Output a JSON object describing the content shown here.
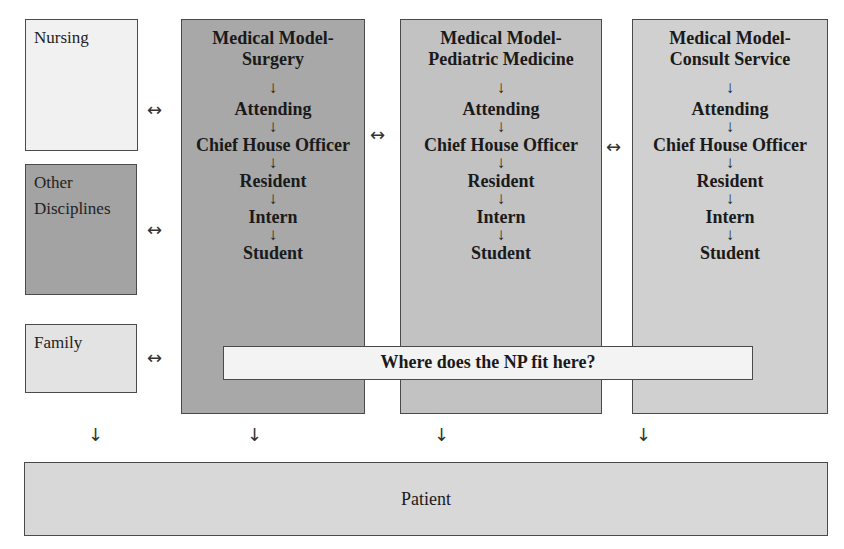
{
  "side_boxes": {
    "nursing": {
      "label": "Nursing",
      "color": "#f1f1f1"
    },
    "other": {
      "label": "Other Disciplines",
      "color": "#a3a3a3"
    },
    "family": {
      "label": "Family",
      "color": "#e3e3e3"
    }
  },
  "models": [
    {
      "title_line1": "Medical Model-",
      "title_line2": "Surgery",
      "color": "#a8a8a8",
      "chain": [
        "Attending",
        "Chief House Officer",
        "Resident",
        "Intern",
        "Student"
      ]
    },
    {
      "title_line1": "Medical Model-",
      "title_line2": "Pediatric Medicine",
      "color": "#c2c2c2",
      "chain": [
        "Attending",
        "Chief House Officer",
        "Resident",
        "Intern",
        "Student"
      ]
    },
    {
      "title_line1": "Medical Model-",
      "title_line2": "Consult Service",
      "color": "#d0d0d0",
      "chain": [
        "Attending",
        "Chief House Officer",
        "Resident",
        "Intern",
        "Student"
      ]
    }
  ],
  "np_question": "Where does the NP fit here?",
  "patient": {
    "label": "Patient",
    "color": "#d8d8d8"
  },
  "symbols": {
    "bidirectional": "↔",
    "down": "↓"
  }
}
